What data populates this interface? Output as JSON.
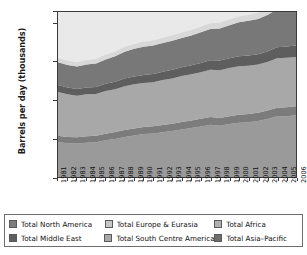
{
  "chart_data": {
    "type": "area",
    "stacked": true,
    "title": "",
    "subtitle": "",
    "xlabel": "",
    "ylabel": "Barrels per day (thousands)",
    "xlim": [
      1981,
      2006
    ],
    "ylim": [
      0,
      86000
    ],
    "yticks": [
      0,
      20000,
      40000,
      60000,
      80000,
      86000
    ],
    "ytick_labels": [
      "0",
      "20 000",
      "40 000",
      "60 000",
      "80 000",
      "86 000"
    ],
    "grid": false,
    "legend_position": "bottom",
    "x": [
      1981,
      1982,
      1983,
      1984,
      1985,
      1986,
      1987,
      1988,
      1989,
      1990,
      1991,
      1992,
      1993,
      1994,
      1995,
      1996,
      1997,
      1998,
      1999,
      2000,
      2001,
      2002,
      2003,
      2004,
      2005,
      2006
    ],
    "categories": [
      "1981",
      "1982",
      "1983",
      "1984",
      "1985",
      "1986",
      "1987",
      "1988",
      "1989",
      "1990",
      "1991",
      "1992",
      "1993",
      "1994",
      "1995",
      "1996",
      "1997",
      "1998",
      "1999",
      "2000",
      "2001",
      "2002",
      "2003",
      "2004",
      "2005",
      "2006"
    ],
    "series": [
      {
        "name": "Total Asia-Pacific",
        "color": "#9a9a9a",
        "values": [
          18200,
          17600,
          17400,
          17900,
          18100,
          19100,
          19800,
          20800,
          21600,
          22400,
          22700,
          23300,
          24000,
          24800,
          25600,
          26300,
          27200,
          26700,
          27600,
          28300,
          28600,
          29200,
          30200,
          31600,
          31700,
          32200
        ]
      },
      {
        "name": "Total North America",
        "color": "#7c7c7c",
        "values": [
          3300,
          3300,
          3300,
          3300,
          3400,
          3500,
          3600,
          3700,
          3700,
          3700,
          3700,
          3800,
          3800,
          3900,
          3900,
          4000,
          4100,
          4100,
          4100,
          4200,
          4200,
          4300,
          4400,
          4500,
          4600,
          4700
        ]
      },
      {
        "name": "Total South Centre America",
        "color": "#a8a8a8",
        "values": [
          22800,
          22200,
          21700,
          21900,
          21700,
          22200,
          22400,
          22800,
          23000,
          22900,
          23000,
          23400,
          23600,
          23900,
          24000,
          24300,
          24600,
          24900,
          25100,
          25200,
          25200,
          25100,
          25300,
          25800,
          25800,
          25600
        ]
      },
      {
        "name": "Total Middle East",
        "color": "#5e5e5e",
        "values": [
          3700,
          3600,
          3500,
          3600,
          3700,
          3800,
          3900,
          4000,
          4100,
          4200,
          4300,
          4400,
          4500,
          4600,
          4700,
          4800,
          4900,
          5000,
          5100,
          5200,
          5300,
          5400,
          5500,
          5700,
          5900,
          6100
        ]
      },
      {
        "name": "Total Europe & Eurasia",
        "color": "#787878",
        "values": [
          11800,
          11700,
          11700,
          11900,
          12300,
          12700,
          13200,
          14000,
          14400,
          14700,
          14800,
          14900,
          15100,
          15300,
          15600,
          16000,
          16400,
          16700,
          17200,
          17700,
          18100,
          18400,
          19000,
          19800,
          20400,
          20900
        ]
      },
      {
        "name": "Total Africa",
        "color": "#d8d8d8",
        "values": [
          2200,
          2200,
          2200,
          2300,
          2300,
          2400,
          2400,
          2500,
          2500,
          2600,
          2600,
          2700,
          2700,
          2800,
          2800,
          2900,
          2900,
          3000,
          3000,
          3100,
          3100,
          3200,
          3200,
          3300,
          3400,
          3500
        ]
      }
    ],
    "totals": [
      62000,
      60600,
      59800,
      60900,
      61500,
      63700,
      65300,
      67800,
      69300,
      70500,
      71100,
      72500,
      73700,
      75300,
      76600,
      78300,
      80100,
      80400,
      82100,
      83700,
      84500,
      85600,
      87600,
      90700,
      91800,
      93000
    ]
  },
  "legend": {
    "row1": [
      {
        "label": "Total North America",
        "color": "#7c7c7c",
        "swatch_name": "swatch-north-america"
      },
      {
        "label": "Total Europe & Eurasia",
        "color": "#c6c6c6",
        "swatch_name": "swatch-europe-eurasia"
      },
      {
        "label": "Total Africa",
        "color": "#b0b0b0",
        "swatch_name": "swatch-africa"
      }
    ],
    "row2": [
      {
        "label": "Total Middle East",
        "color": "#5e5e5e",
        "swatch_name": "swatch-middle-east"
      },
      {
        "label": "Total South Centre America",
        "color": "#a8a8a8",
        "swatch_name": "swatch-south-centre-america"
      },
      {
        "label": "Total Asia–Pacific",
        "color": "#6f6f6f",
        "swatch_name": "swatch-asia-pacific"
      }
    ]
  },
  "axis": {
    "ytitle": "Barrels per day (thousands)",
    "ylabels": [
      "86 000",
      "80 000",
      "60 000",
      "40 000",
      "20 000",
      "0"
    ],
    "xlabels": [
      "1981",
      "1982",
      "1983",
      "1984",
      "1985",
      "1986",
      "1987",
      "1988",
      "1989",
      "1990",
      "1991",
      "1992",
      "1993",
      "1994",
      "1995",
      "1996",
      "1997",
      "1998",
      "1999",
      "2000",
      "2001",
      "2002",
      "2003",
      "2004",
      "2005",
      "2006"
    ]
  },
  "colors": {
    "band_asia_pacific": "#9a9a9a",
    "band_north_america": "#7c7c7c",
    "band_south_centre_america": "#a8a8a8",
    "band_middle_east": "#5e5e5e",
    "band_europe_eurasia": "#787878",
    "band_africa": "#d8d8d8",
    "plot_background": "#e9e9e9",
    "frame": "#3a3a3a"
  }
}
